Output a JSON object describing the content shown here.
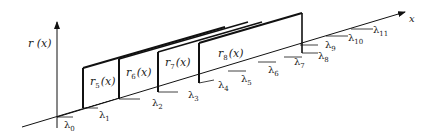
{
  "diagram": {
    "type": "3d-step-function-planes",
    "y_axis_label": "r (x)",
    "x_axis_label": "x",
    "planes": [
      {
        "id": "r5",
        "label": "r",
        "sub": "5",
        "arg": "(x)"
      },
      {
        "id": "r6",
        "label": "r",
        "sub": "6",
        "arg": "(x)"
      },
      {
        "id": "r7",
        "label": "r",
        "sub": "7",
        "arg": "(x)"
      },
      {
        "id": "r8",
        "label": "r",
        "sub": "8",
        "arg": "(x)"
      }
    ],
    "knots": [
      {
        "label": "λ",
        "sub": "0"
      },
      {
        "label": "λ",
        "sub": "1"
      },
      {
        "label": "λ",
        "sub": "2"
      },
      {
        "label": "λ",
        "sub": "3"
      },
      {
        "label": "λ",
        "sub": "4"
      },
      {
        "label": "λ",
        "sub": "5"
      },
      {
        "label": "λ",
        "sub": "6"
      },
      {
        "label": "λ",
        "sub": "7"
      },
      {
        "label": "λ",
        "sub": "8"
      },
      {
        "label": "λ",
        "sub": "9"
      },
      {
        "label": "λ",
        "sub": "10"
      },
      {
        "label": "λ",
        "sub": "11"
      }
    ],
    "colors": {
      "line": "#111111",
      "text": "#222222",
      "background": "#ffffff"
    }
  }
}
